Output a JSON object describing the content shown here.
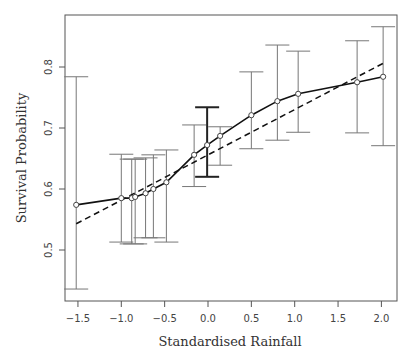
{
  "chart_data": {
    "type": "line",
    "title": "",
    "xlabel": "Standardised Rainfall",
    "ylabel": "Survival Probability",
    "xlim": [
      -1.6,
      2.2
    ],
    "ylim": [
      0.41,
      0.89
    ],
    "xticks": [
      -1.5,
      -1.0,
      -0.5,
      0.0,
      0.5,
      1.0,
      1.5,
      2.0
    ],
    "xtick_labels": [
      "−1.5",
      "−1.0",
      "−0.5",
      "0.0",
      "0.5",
      "1.0",
      "1.5",
      "2.0"
    ],
    "yticks": [
      0.5,
      0.6,
      0.7,
      0.8
    ],
    "ytick_labels": [
      "0.5",
      "0.6",
      "0.7",
      "0.8"
    ],
    "grid": false,
    "legend": null,
    "series": [
      {
        "name": "Estimated survival (with 95% interval)",
        "style": "solid",
        "marker": "open-circle",
        "x": [
          -1.52,
          -1.0,
          -0.88,
          -0.84,
          -0.72,
          -0.63,
          -0.48,
          -0.16,
          -0.01,
          0.14,
          0.5,
          0.8,
          1.04,
          1.72,
          2.02
        ],
        "y": [
          0.574,
          0.585,
          0.585,
          0.587,
          0.593,
          0.6,
          0.611,
          0.656,
          0.672,
          0.687,
          0.721,
          0.744,
          0.756,
          0.775,
          0.784
        ],
        "lower": [
          0.436,
          0.513,
          0.51,
          0.51,
          0.52,
          0.52,
          0.513,
          0.604,
          0.62,
          0.639,
          0.666,
          0.68,
          0.693,
          0.692,
          0.671
        ],
        "upper": [
          0.784,
          0.657,
          0.649,
          0.649,
          0.651,
          0.656,
          0.664,
          0.705,
          0.734,
          0.702,
          0.792,
          0.836,
          0.826,
          0.843,
          0.866
        ]
      },
      {
        "name": "Linear fit",
        "style": "dashed",
        "x": [
          -1.52,
          2.02
        ],
        "y": [
          0.543,
          0.806
        ]
      }
    ],
    "colors": {
      "line": "#111111",
      "errorbar": "#777777",
      "axis": "#555555"
    }
  }
}
